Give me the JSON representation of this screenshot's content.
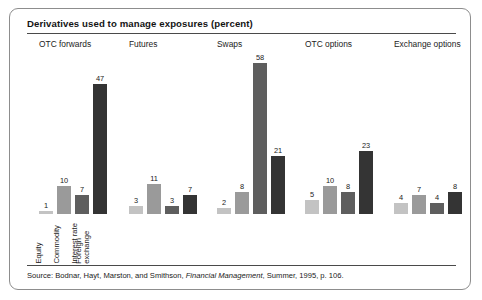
{
  "figure": {
    "title": "Derivatives used to manage exposures (percent)",
    "source_prefix": "Source:  Bodnar, Hayt, Marston, and Smithson, ",
    "source_italic": "Financial Management",
    "source_suffix": ", Summer, 1995, p. 106."
  },
  "colors": {
    "series_equity": "#c3c3c3",
    "series_commodity": "#9a9a9a",
    "series_interest_rate": "#5e5e5e",
    "series_foreign_exchange": "#343434",
    "rule": "#4a4a4a",
    "border": "#8d8d8d"
  },
  "chart_data": {
    "type": "bar",
    "title": "Derivatives used to manage exposures (percent)",
    "xlabel": "",
    "ylabel": "",
    "ylim": [
      0,
      58
    ],
    "grid": false,
    "legend": "none",
    "categories": [
      "OTC forwards",
      "Futures",
      "Swaps",
      "OTC options",
      "Exchange options"
    ],
    "series": [
      {
        "name": "Equity",
        "values": [
          1,
          3,
          2,
          5,
          4
        ]
      },
      {
        "name": "Commodity",
        "values": [
          10,
          11,
          8,
          10,
          7
        ]
      },
      {
        "name": "Interest rate",
        "values": [
          7,
          3,
          58,
          8,
          4
        ]
      },
      {
        "name": "Foreign exchange",
        "values": [
          47,
          7,
          21,
          23,
          8
        ]
      }
    ],
    "series_labels_line1": [
      "Equity",
      "Commodity",
      "Interest rate",
      "Foreign"
    ],
    "series_labels_line2": [
      "",
      "",
      "",
      "exchange"
    ],
    "groups": [
      {
        "label": "OTC forwards",
        "bars": [
          {
            "series": "Equity",
            "value": 1
          },
          {
            "series": "Commodity",
            "value": 10
          },
          {
            "series": "Interest rate",
            "value": 7
          },
          {
            "series": "Foreign exchange",
            "value": 47
          }
        ]
      },
      {
        "label": "Futures",
        "bars": [
          {
            "series": "Equity",
            "value": 3
          },
          {
            "series": "Commodity",
            "value": 11
          },
          {
            "series": "Interest rate",
            "value": 3
          },
          {
            "series": "Foreign exchange",
            "value": 7
          }
        ]
      },
      {
        "label": "Swaps",
        "bars": [
          {
            "series": "Equity",
            "value": 2
          },
          {
            "series": "Commodity",
            "value": 8
          },
          {
            "series": "Interest rate",
            "value": 58
          },
          {
            "series": "Foreign exchange",
            "value": 21
          }
        ]
      },
      {
        "label": "OTC options",
        "bars": [
          {
            "series": "Equity",
            "value": 5
          },
          {
            "series": "Commodity",
            "value": 10
          },
          {
            "series": "Interest rate",
            "value": 8
          },
          {
            "series": "Foreign exchange",
            "value": 23
          }
        ]
      },
      {
        "label": "Exchange options",
        "bars": [
          {
            "series": "Equity",
            "value": 4
          },
          {
            "series": "Commodity",
            "value": 7
          },
          {
            "series": "Interest rate",
            "value": 4
          },
          {
            "series": "Foreign exchange",
            "value": 8
          }
        ]
      }
    ]
  },
  "layout": {
    "group_left_px": [
      12,
      102,
      190,
      278,
      367
    ],
    "max_value": 58,
    "plot_height_px": 160
  }
}
